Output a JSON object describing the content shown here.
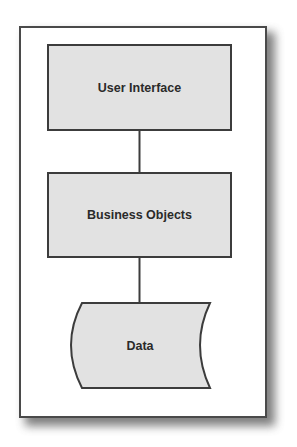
{
  "diagram": {
    "type": "layered-architecture",
    "nodes": [
      {
        "id": "ui",
        "label": "User Interface",
        "shape": "rectangle"
      },
      {
        "id": "bo",
        "label": "Business Objects",
        "shape": "rectangle"
      },
      {
        "id": "data",
        "label": "Data",
        "shape": "stored-data"
      }
    ],
    "edges": [
      {
        "from": "ui",
        "to": "bo"
      },
      {
        "from": "bo",
        "to": "data"
      }
    ],
    "colors": {
      "node_fill": "#e2e2e2",
      "node_stroke": "#3c3c3c",
      "frame_stroke": "#4a4a4a",
      "text": "#2a2a2a"
    }
  }
}
